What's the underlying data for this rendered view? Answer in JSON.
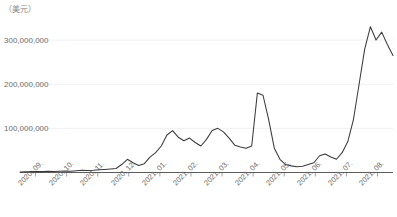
{
  "chart_data": {
    "type": "line",
    "title": "",
    "subtitle": "",
    "unit_label": "（美元）",
    "xlabel": "",
    "ylabel": "",
    "ylim": [
      0,
      350000000
    ],
    "yticks": [
      100000000,
      200000000,
      300000000
    ],
    "ytick_labels": [
      "100,000,000",
      "200,000,000",
      "300,000,000"
    ],
    "grid": true,
    "legend": "none",
    "categories": [
      "2020. 09.",
      "2020. 10.",
      "2020. 11.",
      "2020. 12.",
      "2021. 01.",
      "2021. 02.",
      "2021. 03.",
      "2021. 04.",
      "2021. 05.",
      "2021. 06.",
      "2021. 07.",
      "2021. 08."
    ],
    "line_color": "#3a3a3a",
    "series": [
      {
        "name": "amount",
        "x": [
          "2020.09.01",
          "2020.09.10",
          "2020.09.20",
          "2020.09.30",
          "2020.10.10",
          "2020.10.20",
          "2020.10.31",
          "2020.11.10",
          "2020.11.20",
          "2020.11.30",
          "2020.12.10",
          "2020.12.20",
          "2020.12.31",
          "2021.01.08",
          "2021.01.15",
          "2021.01.22",
          "2021.01.31",
          "2021.02.05",
          "2021.02.10",
          "2021.02.14",
          "2021.02.18",
          "2021.02.22",
          "2021.02.26",
          "2021.03.02",
          "2021.03.06",
          "2021.03.10",
          "2021.03.14",
          "2021.03.18",
          "2021.03.22",
          "2021.03.26",
          "2021.03.31",
          "2021.04.04",
          "2021.04.08",
          "2021.04.12",
          "2021.04.16",
          "2021.04.20",
          "2021.04.24",
          "2021.04.28",
          "2021.05.02",
          "2021.05.06",
          "2021.05.09",
          "2021.05.11",
          "2021.05.13",
          "2021.05.16",
          "2021.05.20",
          "2021.05.25",
          "2021.05.31",
          "2021.06.07",
          "2021.06.14",
          "2021.06.21",
          "2021.06.30",
          "2021.07.08",
          "2021.07.15",
          "2021.07.21",
          "2021.07.25",
          "2021.07.29",
          "2021.08.02",
          "2021.08.05",
          "2021.08.08",
          "2021.08.11",
          "2021.08.14",
          "2021.08.17",
          "2021.08.20",
          "2021.08.23",
          "2021.08.26",
          "2021.08.29",
          "2021.08.31"
        ],
        "values": [
          1000000,
          1500000,
          2000000,
          2500000,
          2000000,
          3000000,
          2500000,
          3000000,
          3500000,
          3000000,
          4000000,
          5000000,
          4500000,
          5000000,
          6000000,
          7000000,
          8000000,
          9000000,
          18000000,
          30000000,
          22000000,
          16000000,
          20000000,
          35000000,
          45000000,
          60000000,
          85000000,
          95000000,
          80000000,
          72000000,
          78000000,
          68000000,
          60000000,
          75000000,
          95000000,
          100000000,
          92000000,
          78000000,
          62000000,
          58000000,
          55000000,
          60000000,
          180000000,
          175000000,
          120000000,
          55000000,
          30000000,
          18000000,
          15000000,
          13000000,
          14000000,
          18000000,
          22000000,
          38000000,
          42000000,
          35000000,
          30000000,
          45000000,
          70000000,
          120000000,
          200000000,
          280000000,
          330000000,
          300000000,
          318000000,
          290000000,
          265000000
        ]
      }
    ],
    "annotations": []
  }
}
